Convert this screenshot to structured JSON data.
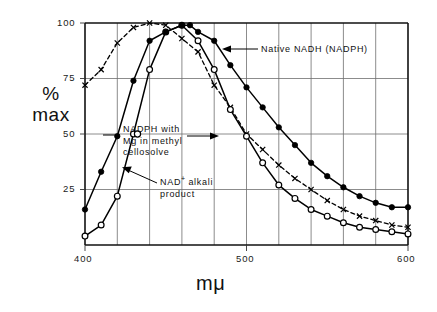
{
  "chart_data": {
    "type": "line",
    "title": "",
    "xlabel": "mμ",
    "ylabel": "%\nmax",
    "ylabel_line1": "%",
    "ylabel_line2": "max",
    "xlim": [
      400,
      600
    ],
    "ylim": [
      0,
      100
    ],
    "grid": true,
    "grid_axes": "both",
    "x_ticks_major": [
      400,
      500,
      600
    ],
    "x_tick_labels": [
      "400",
      "500",
      "600"
    ],
    "x_ticks_minor": [
      420,
      440,
      460,
      480,
      520,
      540,
      560,
      580
    ],
    "y_ticks": [
      25,
      50,
      75,
      100
    ],
    "y_tick_labels": [
      "25",
      "50",
      "75",
      "100"
    ],
    "legend_position": "inline-annotations",
    "series": [
      {
        "name": "Native NADH (NADPH)",
        "marker": "filled-circle",
        "line": "solid",
        "x": [
          400,
          410,
          420,
          430,
          440,
          450,
          460,
          465,
          470,
          480,
          490,
          500,
          510,
          520,
          530,
          540,
          550,
          560,
          570,
          580,
          590,
          600
        ],
        "values": [
          16,
          33,
          49,
          74,
          92,
          96,
          99,
          99,
          96,
          92,
          81,
          71,
          62,
          53,
          45,
          37,
          31,
          26,
          22,
          19,
          17,
          17
        ]
      },
      {
        "name": "NADPH with Mg in methyl cellosolve",
        "marker": "open-circle",
        "line": "solid",
        "x": [
          400,
          410,
          420,
          430,
          440,
          450,
          460,
          470,
          480,
          490,
          500,
          510,
          520,
          530,
          540,
          550,
          560,
          570,
          580,
          590,
          600
        ],
        "values": [
          4,
          9,
          22,
          50,
          79,
          96,
          99,
          92,
          79,
          61,
          49,
          37,
          27,
          21,
          16,
          13,
          10,
          8,
          7,
          6,
          5
        ]
      },
      {
        "name": "NAD+ alkali product",
        "marker": "x",
        "line": "dashed",
        "x": [
          400,
          410,
          420,
          430,
          440,
          450,
          460,
          470,
          480,
          490,
          500,
          510,
          520,
          530,
          540,
          550,
          560,
          570,
          580,
          590,
          600
        ],
        "values": [
          72,
          79,
          91,
          98,
          100,
          99,
          93,
          87,
          72,
          62,
          50,
          43,
          36,
          30,
          25,
          20,
          16,
          13,
          11,
          9,
          8
        ]
      }
    ],
    "annotations": [
      {
        "id": "native",
        "text": "Native  NADH  (NADPH)",
        "arrow": "left",
        "target_series": "Native NADH (NADPH)"
      },
      {
        "id": "nadph",
        "line1": "NADPH  with",
        "line2": "Mg  in  methyl",
        "line3": "cellosolve",
        "arrow": "both",
        "target_series": "NADPH with Mg in methyl cellosolve"
      },
      {
        "id": "nad",
        "line1_pre": "NAD",
        "line1_sup": "+",
        "line1_post": "  alkali",
        "line2": "product",
        "arrow": "left-up",
        "target_series": "NAD+ alkali product"
      }
    ]
  },
  "colors": {
    "ink": "#000000",
    "grid": "#6f6f6f",
    "background": "#ffffff"
  }
}
